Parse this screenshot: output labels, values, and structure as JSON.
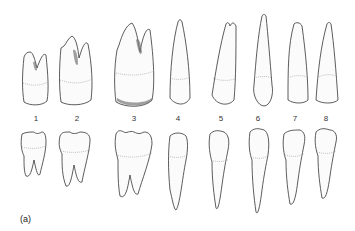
{
  "figure": {
    "panel_label": "(a)",
    "tooth_numbers": [
      "1",
      "2",
      "3",
      "4",
      "5",
      "6",
      "7",
      "8"
    ],
    "rows": [
      "upper teeth (crowns down)",
      "lower teeth (crowns up)"
    ]
  }
}
